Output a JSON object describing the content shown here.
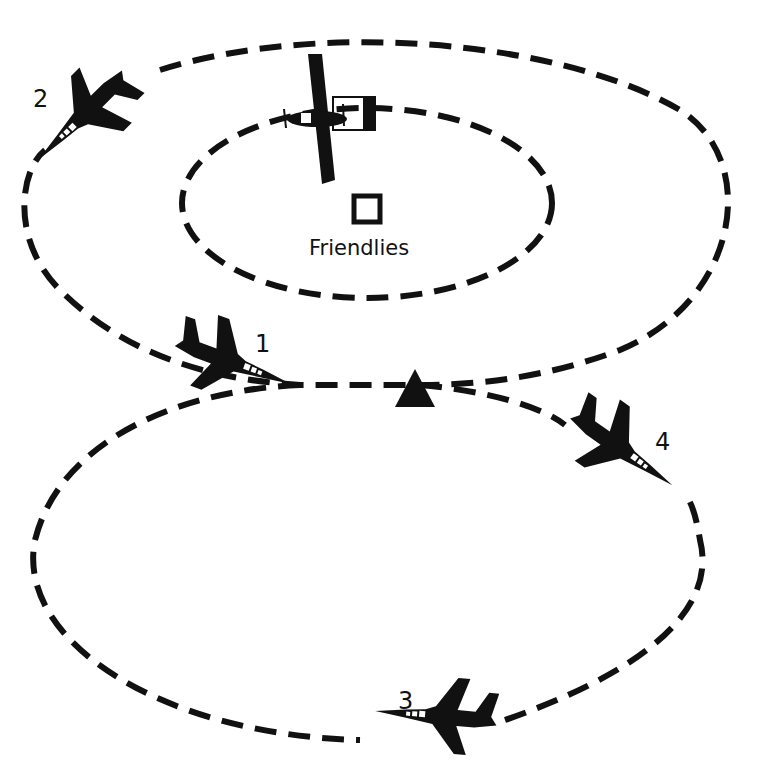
{
  "diagram": {
    "title": "",
    "friendlies_label": "Friendlies",
    "aircraft": [
      {
        "id": "1",
        "label": "1",
        "type": "jet-fighter"
      },
      {
        "id": "2",
        "label": "2",
        "type": "jet-fighter"
      },
      {
        "id": "3",
        "label": "3",
        "type": "jet-fighter"
      },
      {
        "id": "4",
        "label": "4",
        "type": "jet-fighter"
      }
    ],
    "fac_aircraft": {
      "type": "propeller-observation-aircraft"
    },
    "markers": [
      {
        "type": "friendlies-square"
      },
      {
        "type": "ip-triangle"
      }
    ],
    "patterns": [
      {
        "name": "inner-orbit",
        "style": "dashed"
      },
      {
        "name": "upper-racetrack",
        "style": "dashed"
      },
      {
        "name": "lower-racetrack",
        "style": "dashed"
      }
    ],
    "colors": {
      "ink": "#111111",
      "background": "#ffffff"
    }
  }
}
